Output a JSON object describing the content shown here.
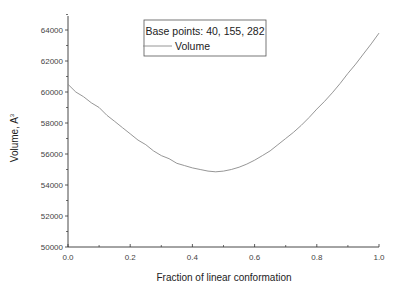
{
  "chart_data": {
    "type": "line",
    "title": "",
    "xlabel": "Fraction of linear conformation",
    "ylabel": "Volume, A",
    "ylabel_superscript": "3",
    "xlim": [
      0.0,
      1.0
    ],
    "ylim": [
      50000,
      64000
    ],
    "xticks": [
      "0.0",
      "0.2",
      "0.4",
      "0.6",
      "0.8",
      "1.0"
    ],
    "xtick_values": [
      0.0,
      0.2,
      0.4,
      0.6,
      0.8,
      1.0
    ],
    "yticks": [
      "50000",
      "52000",
      "54000",
      "56000",
      "58000",
      "60000",
      "62000",
      "64000"
    ],
    "ytick_values": [
      50000,
      52000,
      54000,
      56000,
      58000,
      60000,
      62000,
      64000
    ],
    "grid": false,
    "legend": {
      "title": "Base points: 40, 155, 282",
      "placement": "top-center",
      "entries": [
        "Volume"
      ]
    },
    "series": [
      {
        "name": "Volume",
        "color": "#8a8a8a",
        "x": [
          0.0,
          0.025,
          0.05,
          0.075,
          0.1,
          0.125,
          0.15,
          0.175,
          0.2,
          0.225,
          0.25,
          0.275,
          0.3,
          0.325,
          0.35,
          0.375,
          0.4,
          0.425,
          0.45,
          0.475,
          0.5,
          0.525,
          0.55,
          0.575,
          0.6,
          0.625,
          0.65,
          0.675,
          0.7,
          0.725,
          0.75,
          0.775,
          0.8,
          0.825,
          0.85,
          0.875,
          0.9,
          0.925,
          0.95,
          0.975,
          1.0
        ],
        "y": [
          60500,
          60000,
          59700,
          59300,
          59000,
          58500,
          58100,
          57700,
          57300,
          56900,
          56600,
          56200,
          55900,
          55700,
          55400,
          55250,
          55100,
          55000,
          54900,
          54850,
          54900,
          55000,
          55150,
          55350,
          55600,
          55900,
          56200,
          56600,
          57000,
          57400,
          57850,
          58350,
          58900,
          59400,
          59950,
          60550,
          61200,
          61800,
          62450,
          63100,
          63800
        ]
      }
    ]
  }
}
